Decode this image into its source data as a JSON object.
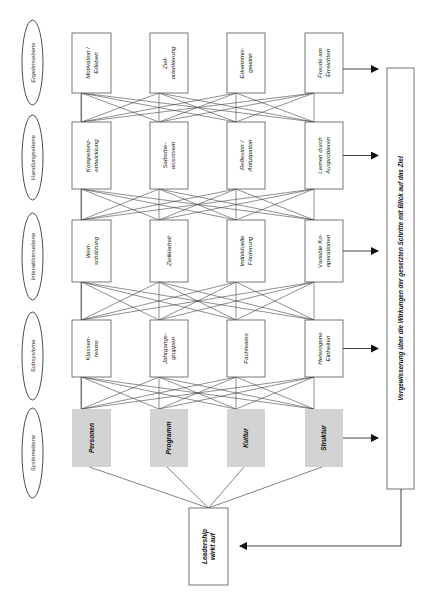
{
  "levels": [
    {
      "label": "Ergebnisebene"
    },
    {
      "label": "Handlungsebene"
    },
    {
      "label": "Interaktionsebene"
    },
    {
      "label": "Subsysteme"
    },
    {
      "label": "Systemebene"
    }
  ],
  "rows": [
    {
      "name": "ergebnisebene",
      "boxes": [
        {
          "lines": [
            "Motivation /",
            "Erleben"
          ]
        },
        {
          "lines": [
            "Ziel-",
            "orientierung"
          ]
        },
        {
          "lines": [
            "Erkenntnis-",
            "gewinn"
          ]
        },
        {
          "lines": [
            "Freude am",
            "Erreichten"
          ]
        }
      ]
    },
    {
      "name": "handlungsebene",
      "boxes": [
        {
          "lines": [
            "Kompetenz-",
            "entwicklung"
          ]
        },
        {
          "lines": [
            "Selbstbe-",
            "wusstsein"
          ]
        },
        {
          "lines": [
            "Reflexion /",
            "Antizipation"
          ]
        },
        {
          "lines": [
            "Lernen   durch",
            "Ausprobieren"
          ]
        }
      ]
    },
    {
      "name": "interaktionsebene",
      "boxes": [
        {
          "lines": [
            "Wert-",
            "schätzung"
          ]
        },
        {
          "lines": [
            "Zielklarheit"
          ]
        },
        {
          "lines": [
            "Individuelle",
            "Förderung"
          ]
        },
        {
          "lines": [
            "Variable   Ko-",
            "operationen"
          ]
        }
      ]
    },
    {
      "name": "subsysteme",
      "boxes": [
        {
          "lines": [
            "Klassen-",
            "teams"
          ]
        },
        {
          "lines": [
            "Jahrgangs-",
            "gruppen"
          ]
        },
        {
          "lines": [
            "Fachteams"
          ]
        },
        {
          "lines": [
            "Heterogene",
            "Einheiten"
          ]
        }
      ]
    },
    {
      "name": "systemebene",
      "boxes": [
        {
          "lines": [
            "Personen"
          ]
        },
        {
          "lines": [
            "Programm"
          ]
        },
        {
          "lines": [
            "Kultur"
          ]
        },
        {
          "lines": [
            "Struktur"
          ]
        }
      ]
    }
  ],
  "leadership": {
    "lines": [
      "Leadership",
      "wirkt auf"
    ]
  },
  "reflection": {
    "label": "Vergewisserung über die Wirkungen der gesetzten Schritte mit Blick auf das  Ziel"
  },
  "colors": {
    "line": "#333333",
    "box_border": "#555555",
    "system_fill": "#d3d3d3"
  }
}
